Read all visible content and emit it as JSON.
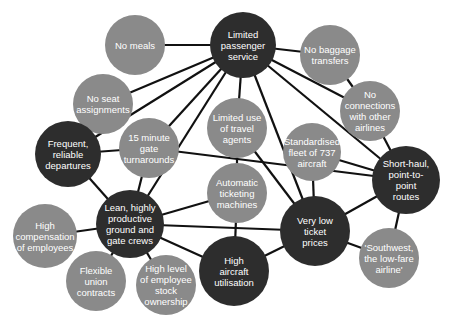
{
  "colors": {
    "dark_node": "#2d2d2d",
    "light_node": "#8a8a8a",
    "edge": "#111111",
    "background": "#ffffff",
    "text": "#ffffff"
  },
  "nodes": [
    {
      "id": "limited-passenger-service",
      "lines": [
        "Limited",
        "passenger",
        "service"
      ],
      "x": 243,
      "y": 45,
      "r": 33,
      "type": "dark"
    },
    {
      "id": "no-meals",
      "lines": [
        "No meals"
      ],
      "x": 135,
      "y": 45,
      "r": 30,
      "type": "light"
    },
    {
      "id": "no-baggage-transfers",
      "lines": [
        "No baggage",
        "transfers"
      ],
      "x": 330,
      "y": 55,
      "r": 30,
      "type": "light"
    },
    {
      "id": "no-seat-assignments",
      "lines": [
        "No seat",
        "assignments"
      ],
      "x": 103,
      "y": 104,
      "r": 30,
      "type": "light"
    },
    {
      "id": "no-connections",
      "lines": [
        "No",
        "connections",
        "with other",
        "airlines"
      ],
      "x": 370,
      "y": 111,
      "r": 30,
      "type": "light"
    },
    {
      "id": "limited-travel-agents",
      "lines": [
        "Limited use",
        "of travel",
        "agents"
      ],
      "x": 237,
      "y": 128,
      "r": 30,
      "type": "light"
    },
    {
      "id": "gate-turnarounds",
      "lines": [
        "15 minute",
        "gate",
        "turnarounds"
      ],
      "x": 149,
      "y": 148,
      "r": 30,
      "type": "light"
    },
    {
      "id": "standardised-fleet",
      "lines": [
        "Standardised",
        "fleet of 737",
        "aircraft"
      ],
      "x": 312,
      "y": 152,
      "r": 29,
      "type": "light"
    },
    {
      "id": "frequent-departures",
      "lines": [
        "Frequent,",
        "reliable",
        "departures"
      ],
      "x": 68,
      "y": 154,
      "r": 33,
      "type": "dark"
    },
    {
      "id": "short-haul-routes",
      "lines": [
        "Short-haul,",
        "point-to-",
        "point",
        "routes"
      ],
      "x": 406,
      "y": 180,
      "r": 34,
      "type": "dark"
    },
    {
      "id": "automatic-ticketing",
      "lines": [
        "Automatic",
        "ticketing",
        "machines"
      ],
      "x": 237,
      "y": 193,
      "r": 30,
      "type": "light"
    },
    {
      "id": "lean-crews",
      "lines": [
        "Lean, highly",
        "productive",
        "ground and",
        "gate crews"
      ],
      "x": 130,
      "y": 224,
      "r": 34,
      "type": "dark"
    },
    {
      "id": "high-compensation",
      "lines": [
        "High",
        "compensation",
        "of employees"
      ],
      "x": 45,
      "y": 236,
      "r": 32,
      "type": "light"
    },
    {
      "id": "very-low-prices",
      "lines": [
        "Very low",
        "ticket",
        "prices"
      ],
      "x": 315,
      "y": 231,
      "r": 35,
      "type": "dark"
    },
    {
      "id": "southwest",
      "lines": [
        "'Southwest,",
        "the low-fare",
        "airline'"
      ],
      "x": 389,
      "y": 258,
      "r": 30,
      "type": "light"
    },
    {
      "id": "flexible-union",
      "lines": [
        "Flexible",
        "union",
        "contracts"
      ],
      "x": 96,
      "y": 281,
      "r": 30,
      "type": "light"
    },
    {
      "id": "stock-ownership",
      "lines": [
        "High level",
        "of employee",
        "stock",
        "ownership"
      ],
      "x": 166,
      "y": 285,
      "r": 30,
      "type": "light"
    },
    {
      "id": "high-utilisation",
      "lines": [
        "High",
        "aircraft",
        "utilisation"
      ],
      "x": 234,
      "y": 271,
      "r": 35,
      "type": "dark"
    }
  ],
  "edges": [
    [
      "limited-passenger-service",
      "no-meals"
    ],
    [
      "limited-passenger-service",
      "no-baggage-transfers"
    ],
    [
      "limited-passenger-service",
      "no-seat-assignments"
    ],
    [
      "limited-passenger-service",
      "no-connections"
    ],
    [
      "limited-passenger-service",
      "limited-travel-agents"
    ],
    [
      "limited-passenger-service",
      "gate-turnarounds"
    ],
    [
      "limited-passenger-service",
      "frequent-departures"
    ],
    [
      "limited-passenger-service",
      "lean-crews"
    ],
    [
      "limited-passenger-service",
      "very-low-prices"
    ],
    [
      "limited-passenger-service",
      "short-haul-routes"
    ],
    [
      "no-baggage-transfers",
      "no-connections"
    ],
    [
      "no-connections",
      "short-haul-routes"
    ],
    [
      "frequent-departures",
      "gate-turnarounds"
    ],
    [
      "frequent-departures",
      "lean-crews"
    ],
    [
      "gate-turnarounds",
      "lean-crews"
    ],
    [
      "gate-turnarounds",
      "short-haul-routes"
    ],
    [
      "limited-travel-agents",
      "automatic-ticketing"
    ],
    [
      "limited-travel-agents",
      "very-low-prices"
    ],
    [
      "standardised-fleet",
      "short-haul-routes"
    ],
    [
      "standardised-fleet",
      "very-low-prices"
    ],
    [
      "lean-crews",
      "automatic-ticketing"
    ],
    [
      "lean-crews",
      "very-low-prices"
    ],
    [
      "lean-crews",
      "high-utilisation"
    ],
    [
      "lean-crews",
      "high-compensation"
    ],
    [
      "lean-crews",
      "flexible-union"
    ],
    [
      "lean-crews",
      "stock-ownership"
    ],
    [
      "automatic-ticketing",
      "high-utilisation"
    ],
    [
      "very-low-prices",
      "high-utilisation"
    ],
    [
      "very-low-prices",
      "short-haul-routes"
    ],
    [
      "very-low-prices",
      "southwest"
    ],
    [
      "short-haul-routes",
      "southwest"
    ]
  ]
}
